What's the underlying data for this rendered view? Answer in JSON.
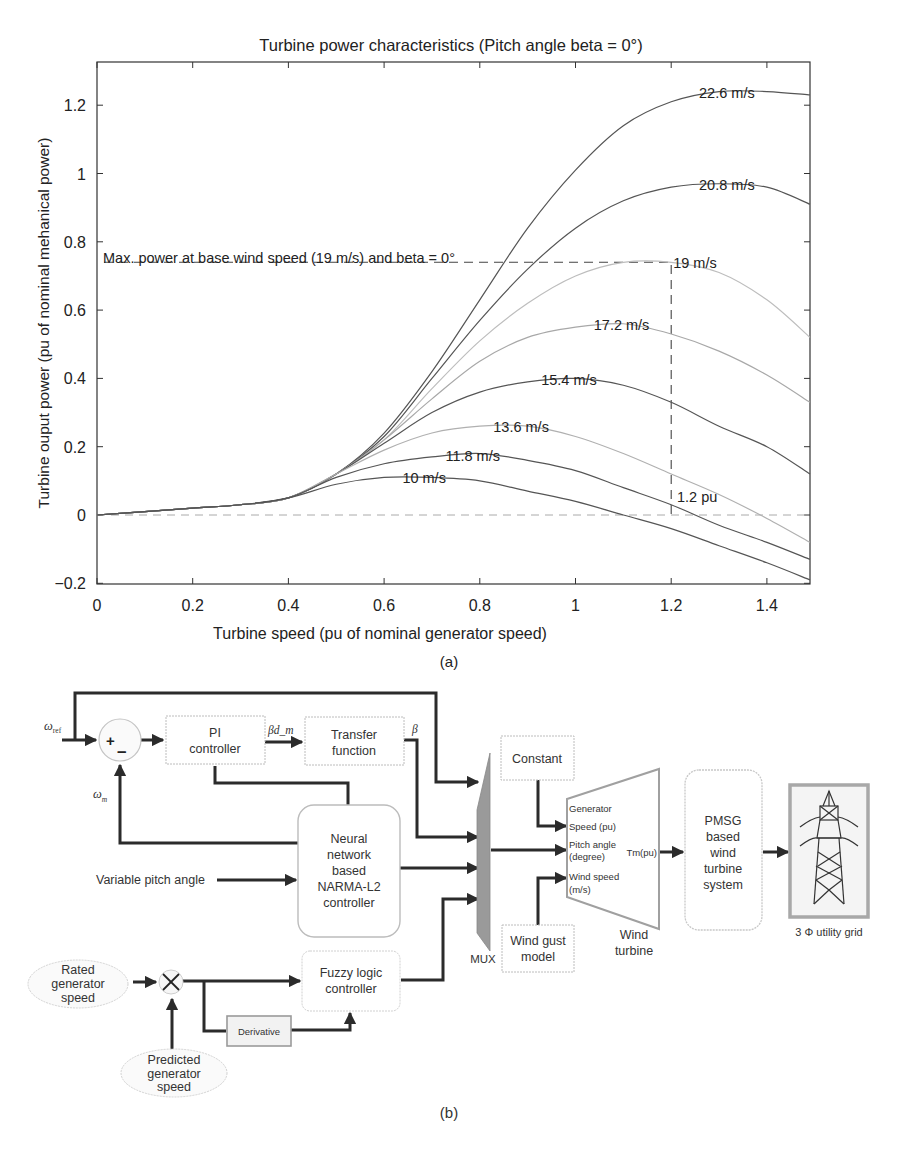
{
  "panel_a": {
    "caption": "(a)",
    "title": "Turbine power characteristics (Pitch angle beta = 0°)",
    "xlabel": "Turbine speed (pu of nominal generator speed)",
    "ylabel": "Turbine ouput power (pu of nominal mehanical power)",
    "annotation_max": "Max. power at base wind speed (19 m/s) and beta = 0°",
    "annotation_pu": "1.2 pu",
    "xticks": [
      "0",
      "0.2",
      "0.4",
      "0.6",
      "0.8",
      "1",
      "1.2",
      "1.4"
    ],
    "yticks": [
      "-0.2",
      "0",
      "0.2",
      "0.4",
      "0.6",
      "0.8",
      "1",
      "1.2"
    ]
  },
  "chart_data": {
    "type": "line",
    "title": "Turbine power characteristics (Pitch angle beta = 0°)",
    "xlabel": "Turbine speed (pu of nominal generator speed)",
    "ylabel": "Turbine ouput power (pu of nominal mehanical power)",
    "xlim": [
      0,
      1.49
    ],
    "ylim": [
      -0.2,
      1.32
    ],
    "grid": false,
    "legend": "inline labels",
    "x": [
      0,
      0.1,
      0.2,
      0.3,
      0.4,
      0.5,
      0.6,
      0.7,
      0.8,
      0.9,
      1.0,
      1.1,
      1.2,
      1.3,
      1.4,
      1.49
    ],
    "series": [
      {
        "name": "22.6 m/s",
        "label_x": 1.3,
        "values": [
          0,
          0.01,
          0.02,
          0.03,
          0.05,
          0.12,
          0.24,
          0.42,
          0.63,
          0.84,
          1.01,
          1.14,
          1.21,
          1.24,
          1.24,
          1.23
        ]
      },
      {
        "name": "20.8 m/s",
        "label_x": 1.3,
        "values": [
          0,
          0.01,
          0.02,
          0.03,
          0.05,
          0.12,
          0.23,
          0.4,
          0.57,
          0.72,
          0.84,
          0.92,
          0.96,
          0.97,
          0.96,
          0.91
        ]
      },
      {
        "name": "19 m/s",
        "label_x": 1.2,
        "values": [
          0,
          0.01,
          0.02,
          0.03,
          0.05,
          0.12,
          0.22,
          0.37,
          0.51,
          0.62,
          0.7,
          0.74,
          0.74,
          0.71,
          0.63,
          0.52
        ]
      },
      {
        "name": "17.2 m/s",
        "label_x": 1.08,
        "values": [
          0,
          0.01,
          0.02,
          0.03,
          0.05,
          0.12,
          0.22,
          0.34,
          0.45,
          0.52,
          0.55,
          0.56,
          0.53,
          0.48,
          0.41,
          0.33
        ]
      },
      {
        "name": "15.4 m/s",
        "label_x": 0.97,
        "values": [
          0,
          0.01,
          0.02,
          0.03,
          0.05,
          0.12,
          0.21,
          0.3,
          0.36,
          0.39,
          0.4,
          0.38,
          0.33,
          0.26,
          0.2,
          0.12
        ]
      },
      {
        "name": "13.6 m/s",
        "label_x": 0.87,
        "values": [
          0,
          0.01,
          0.02,
          0.03,
          0.05,
          0.12,
          0.19,
          0.24,
          0.26,
          0.26,
          0.23,
          0.18,
          0.12,
          0.06,
          -0.01,
          -0.08
        ]
      },
      {
        "name": "11.8 m/s",
        "label_x": 0.77,
        "values": [
          0,
          0.01,
          0.02,
          0.03,
          0.05,
          0.11,
          0.15,
          0.17,
          0.18,
          0.16,
          0.13,
          0.08,
          0.03,
          -0.03,
          -0.08,
          -0.13
        ]
      },
      {
        "name": "10 m/s",
        "label_x": 0.68,
        "values": [
          0,
          0.01,
          0.02,
          0.03,
          0.05,
          0.09,
          0.11,
          0.11,
          0.1,
          0.07,
          0.04,
          0.0,
          -0.04,
          -0.09,
          -0.14,
          -0.19
        ]
      }
    ],
    "annotations": [
      {
        "text": "Max. power at base wind speed (19 m/s) and beta = 0°",
        "hline_y": 0.74,
        "x_range": [
          0,
          1.2
        ]
      },
      {
        "text": "1.2 pu",
        "vline_x": 1.2,
        "y_range": [
          0,
          0.74
        ]
      },
      {
        "text": "zero line",
        "hline_y": 0,
        "style": "dashed"
      }
    ]
  },
  "panel_b": {
    "caption": "(b)",
    "signals": {
      "omega_ref": "ω",
      "omega_ref_sub": "ref",
      "omega_m": "ω",
      "omega_m_sub": "m",
      "beta_dm": "βd_m",
      "beta": "β",
      "plus": "+",
      "minus": "–",
      "multiply": "×"
    },
    "blocks": {
      "pi_controller": [
        "PI",
        "controller"
      ],
      "transfer_function": [
        "Transfer",
        "function"
      ],
      "neural_network": [
        "Neural",
        "network",
        "based",
        "NARMA-L2",
        "controller"
      ],
      "variable_pitch": "Variable pitch angle",
      "fuzzy_logic": [
        "Fuzzy logic",
        "controller"
      ],
      "derivative": "Derivative",
      "rated_speed": [
        "Rated",
        "generator",
        "speed"
      ],
      "predicted_speed": [
        "Predicted",
        "generator",
        "speed"
      ],
      "mux": "MUX",
      "constant": "Constant",
      "wind_gust": [
        "Wind gust",
        "model"
      ],
      "wind_turbine_ports": [
        "Generator",
        "Speed (pu)",
        "Pitch angle",
        "(degree)",
        "Wind speed",
        "(m/s)"
      ],
      "wind_turbine_output": "Tm(pu)",
      "wind_turbine_label": [
        "Wind",
        "turbine"
      ],
      "pmsg": [
        "PMSG",
        "based",
        "wind",
        "turbine",
        "system"
      ],
      "grid_label": "3 Φ utility grid"
    },
    "colors": {
      "wire": "#2b2b2b",
      "block_border": "#b8b8b8",
      "mux_fill": "#9a9a9a",
      "grid_frame": "#a8a8a8"
    }
  }
}
